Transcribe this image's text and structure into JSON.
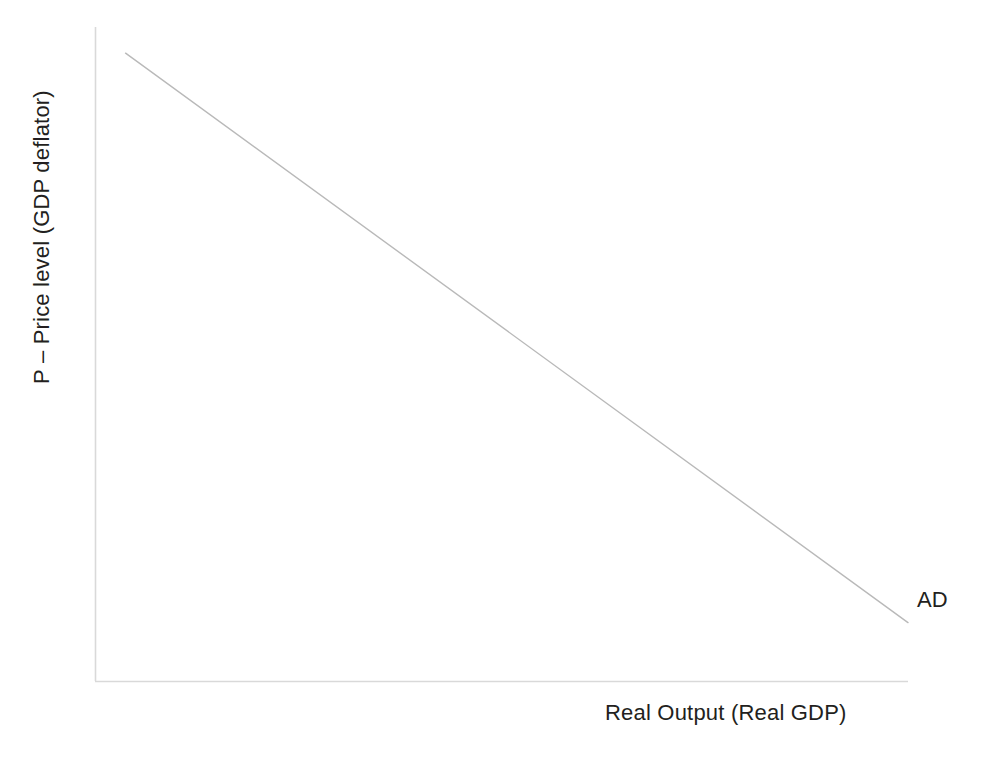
{
  "chart_data": {
    "type": "line",
    "title": "",
    "subtitle": "",
    "xlabel": "Real Output (Real GDP)",
    "ylabel": "P – Price level (GDP deflator)",
    "grid": false,
    "legend_position": "inline-right-end",
    "xlim": [
      0,
      100
    ],
    "ylim": [
      0,
      100
    ],
    "tick_labels": {
      "x": [],
      "y": []
    },
    "annotations": [
      {
        "name": "ad-curve-label",
        "text": "AD",
        "x": 101,
        "y": 10
      }
    ],
    "series": [
      {
        "name": "AD",
        "label": "AD",
        "description": "Aggregate demand curve – downward sloping straight line",
        "color": "#b9b9b9",
        "style": "solid",
        "width": 1.4,
        "x": [
          3.7,
          100.0
        ],
        "y": [
          96.0,
          9.0
        ],
        "points": [
          {
            "x": 3.7,
            "y": 96.0
          },
          {
            "x": 100.0,
            "y": 9.0
          }
        ]
      }
    ],
    "axes": {
      "x_axis_color": "#d9d9d9",
      "y_axis_color": "#d9d9d9",
      "spines": [
        "left",
        "bottom"
      ]
    }
  },
  "labels": {
    "y_axis": "P – Price level (GDP deflator)",
    "x_axis": "Real Output (Real GDP)",
    "ad_curve": "AD"
  },
  "colors": {
    "background": "#ffffff",
    "text": "#231f20",
    "axis": "#d9d9d9",
    "curve": "#b9b9b9"
  }
}
